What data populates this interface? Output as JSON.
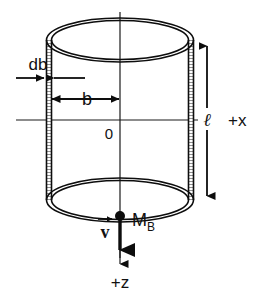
{
  "figure": {
    "background_color": "#ffffff",
    "line_color": "#0d0d0d"
  },
  "labels": {
    "thickness": "db",
    "radius": "b",
    "origin": "0",
    "x_axis": "+x",
    "z_axis": "+z",
    "length": "ℓ",
    "mass_symbol": "M",
    "mass_subscript": "B",
    "velocity": "v"
  },
  "geometry": {
    "center_x": 120,
    "center_y": 120,
    "radius_x": 71,
    "top_ellipse_cy": 40,
    "bottom_ellipse_cy": 200,
    "ellipse_ry": 21,
    "left_wall_x": 49,
    "right_wall_x": 191,
    "x_axis_left": 16,
    "x_axis_right": 223,
    "z_axis_bottom": 268,
    "axis_top": 12
  },
  "annotations": {
    "db_arrows": "inward-pointing pair at the left wall",
    "b_arrows": "double-headed arrow from left wall to central axis",
    "length_arrows": "double-headed vertical arrow at right of cylinder",
    "velocity_arrows": "bold downward arrow from point mass along +z"
  }
}
